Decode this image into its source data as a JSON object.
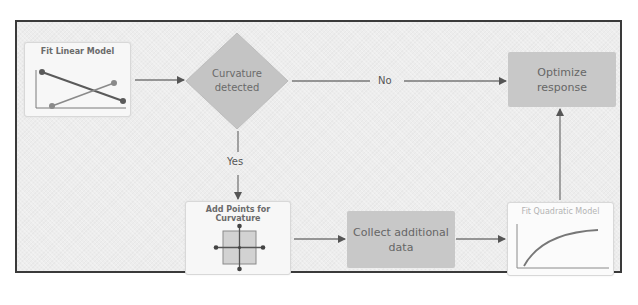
{
  "diagram": {
    "type": "flowchart",
    "nodes": {
      "fit_linear": {
        "title": "Fit Linear Model",
        "thumbnail": "crossing-lines-plot-icon"
      },
      "curvature": {
        "line1": "Curvature",
        "line2": "detected",
        "shape": "diamond"
      },
      "optimize": {
        "line1": "Optimize",
        "line2": "response"
      },
      "add_points": {
        "line1": "Add Points for",
        "line2": "Curvature",
        "thumbnail": "center-axial-points-icon"
      },
      "collect": {
        "line1": "Collect additional",
        "line2": "data"
      },
      "fit_quadratic": {
        "title": "Fit Quadratic Model",
        "thumbnail": "curve-plot-icon"
      }
    },
    "edges": [
      {
        "from": "Fit Linear Model",
        "to": "Curvature detected",
        "label": ""
      },
      {
        "from": "Curvature detected",
        "to": "Optimize response",
        "label": "No"
      },
      {
        "from": "Curvature detected",
        "to": "Add Points for Curvature",
        "label": "Yes"
      },
      {
        "from": "Add Points for Curvature",
        "to": "Collect additional data",
        "label": ""
      },
      {
        "from": "Collect additional data",
        "to": "Fit Quadratic Model",
        "label": ""
      },
      {
        "from": "Fit Quadratic Model",
        "to": "Optimize response",
        "label": ""
      }
    ],
    "edge_labels": {
      "no": "No",
      "yes": "Yes"
    },
    "colors": {
      "frame_border": "#3a3a3a",
      "background": "#ededed",
      "process_fill": "#c8c8c8",
      "card_fill": "#f7f7f7",
      "arrow": "#666666",
      "plot_line_dark": "#5a5a5a",
      "plot_line_light": "#8a8a8a"
    }
  }
}
